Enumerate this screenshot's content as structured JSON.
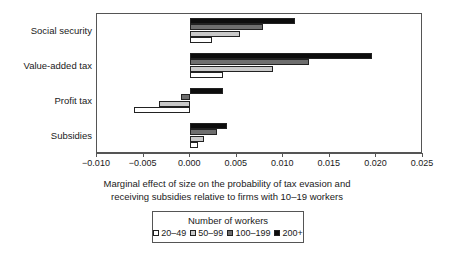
{
  "chart_data": {
    "type": "bar",
    "orientation": "horizontal",
    "title": "",
    "xlabel": "Marginal effect of size on the probability of tax evasion and receiving subsidies relative to firms with 10–19 workers",
    "ylabel": "",
    "categories": [
      "Social security",
      "Value-added tax",
      "Profit tax",
      "Subsidies"
    ],
    "xlim": [
      -0.01,
      0.025
    ],
    "xticks": [
      -0.01,
      -0.005,
      0.0,
      0.005,
      0.01,
      0.015,
      0.02,
      0.025
    ],
    "xtick_labels": [
      "−0.010",
      "−0.005",
      "0.000",
      "0.005",
      "0.010",
      "0.015",
      "0.020",
      "0.025"
    ],
    "grid": false,
    "legend_position": "bottom",
    "legend_title": "Number of workers",
    "series": [
      {
        "name": "20–49",
        "color": "#ffffff",
        "values": [
          0.0024,
          0.0035,
          -0.006,
          0.0008
        ]
      },
      {
        "name": "50–99",
        "color": "#c9c9c9",
        "values": [
          0.0053,
          0.0089,
          -0.0033,
          0.0015
        ]
      },
      {
        "name": "100–199",
        "color": "#6e6e6e",
        "values": [
          0.0078,
          0.0128,
          -0.001,
          0.0029
        ]
      },
      {
        "name": "200+",
        "color": "#0d0d0d",
        "values": [
          0.0113,
          0.0195,
          0.0035,
          0.004
        ]
      }
    ]
  },
  "axis": {
    "caption_line1": "Marginal effect of size on the probability of tax evasion and",
    "caption_line2": "receiving subsidies relative to firms with 10–19 workers"
  },
  "legend": {
    "title": "Number of workers",
    "items": [
      {
        "label": "20–49",
        "color": "#ffffff"
      },
      {
        "label": "50–99",
        "color": "#c9c9c9"
      },
      {
        "label": "100–199",
        "color": "#6e6e6e"
      },
      {
        "label": "200+",
        "color": "#0d0d0d"
      }
    ]
  }
}
